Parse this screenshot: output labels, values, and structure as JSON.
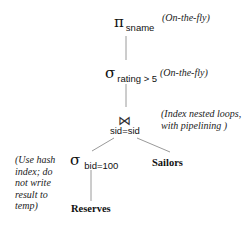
{
  "diagram": {
    "nodes": {
      "projection": {
        "symbol": "π",
        "subscript": "sname",
        "annotation": "(On-the-fly)"
      },
      "selection_rating": {
        "symbol": "σ",
        "subscript": "rating > 5",
        "annotation": "(On-the-fly)"
      },
      "join": {
        "symbol": "⋈",
        "condition": "sid=sid",
        "annotation_lines": [
          "(Index nested loops,",
          "with pipelining )"
        ]
      },
      "selection_bid": {
        "symbol": "σ",
        "subscript": "bid=100",
        "annotation_lines": [
          "(Use hash",
          "index; do",
          "not write",
          "result to",
          "temp)"
        ]
      },
      "reserves": {
        "label": "Reserves"
      },
      "sailors": {
        "label": "Sailors"
      }
    },
    "edges": [
      {
        "from": "projection",
        "to": "selection_rating"
      },
      {
        "from": "selection_rating",
        "to": "join"
      },
      {
        "from": "join",
        "to": "selection_bid"
      },
      {
        "from": "join",
        "to": "sailors"
      },
      {
        "from": "selection_bid",
        "to": "reserves"
      }
    ],
    "colors": {
      "line": "#9a9a9a",
      "text": "#111111"
    }
  }
}
